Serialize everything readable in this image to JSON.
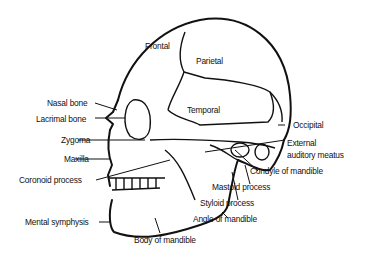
{
  "diagram": {
    "labels": {
      "frontal": "Frontal",
      "parietal": "Parietal",
      "temporal": "Temporal",
      "occipital": "Occipital",
      "nasal_bone": "Nasal bone",
      "lacrimal_bone": "Lacrimal bone",
      "zygoma": "Zygoma",
      "maxilla": "Maxilla",
      "coronoid_process": "Coronoid process",
      "mental_symphysis": "Mental symphysis",
      "body_of_mandible": "Body of mandible",
      "angle_of_mandible": "Angle of mandible",
      "styloid_process": "Styloid process",
      "mastoid_process": "Mastoid process",
      "condyle_of_mandible": "Condyle of mandible",
      "external_auditory_meatus_1": "External",
      "external_auditory_meatus_2": "auditory meatus"
    },
    "colors": {
      "line": "#111111",
      "background": "#ffffff"
    }
  }
}
